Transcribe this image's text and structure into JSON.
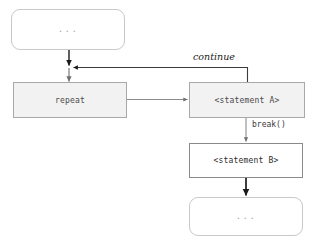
{
  "diagram": {
    "canvas": {
      "width": 312,
      "height": 248,
      "background": "#ffffff"
    },
    "colors": {
      "page_background": "#ffffff",
      "terminal_fill": "#ffffff",
      "terminal_border": "#c9c9c9",
      "terminal_text": "#a6a6a6",
      "process_filled_fill": "#f2f2f2",
      "process_filled_border": "#a8a8a8",
      "process_plain_fill": "#ffffff",
      "process_plain_border": "#8a8a8a",
      "edge_gray": "#8d8d8d",
      "edge_dark": "#1a1a1a",
      "label_text": "#1a1a1a"
    },
    "nodes": [
      {
        "id": "top",
        "shape": "rounded-rectangle",
        "label": "...",
        "style": "terminal"
      },
      {
        "id": "repeat",
        "shape": "rectangle",
        "label": "repeat",
        "style": "filled"
      },
      {
        "id": "statement-a",
        "shape": "rectangle",
        "label": "<statement A>",
        "style": "filled"
      },
      {
        "id": "statement-b",
        "shape": "rectangle",
        "label": "<statement B>",
        "style": "plain"
      },
      {
        "id": "bottom",
        "shape": "rounded-rectangle",
        "label": "...",
        "style": "terminal"
      }
    ],
    "edges": [
      {
        "id": "top-to-repeat",
        "from": "top",
        "to": "repeat",
        "label": "",
        "direction": "down",
        "color": "dark"
      },
      {
        "id": "repeat-to-statement-a",
        "from": "repeat",
        "to": "statement-a",
        "label": "",
        "direction": "right",
        "color": "gray"
      },
      {
        "id": "statement-a-continue-loop",
        "from": "statement-a",
        "to": "repeat",
        "label": "continue",
        "direction": "up-left-loop",
        "color": "dark"
      },
      {
        "id": "statement-a-to-statement-b",
        "from": "statement-a",
        "to": "statement-b",
        "label": "break()",
        "direction": "down",
        "color": "gray"
      },
      {
        "id": "statement-b-to-bottom",
        "from": "statement-b",
        "to": "bottom",
        "label": "",
        "direction": "down",
        "color": "dark"
      }
    ]
  }
}
